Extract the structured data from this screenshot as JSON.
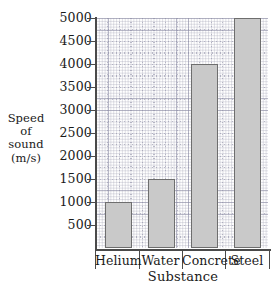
{
  "chart_data": {
    "type": "bar",
    "title": "",
    "xlabel": "Substance",
    "ylabel": "Speed of sound (m/s)",
    "ylabel_lines": [
      "Speed",
      "of",
      "sound",
      "(m/s)"
    ],
    "categories": [
      "Helium",
      "Water",
      "Concrete",
      "Steel"
    ],
    "values": [
      1000,
      1500,
      4000,
      5000
    ],
    "ylim": [
      0,
      5000
    ],
    "ytick_step": 500,
    "yticks": [
      5000,
      4500,
      4000,
      3500,
      3000,
      2500,
      2000,
      1500,
      1000,
      500
    ],
    "ytick_labels": [
      "5000",
      "4500",
      "4000",
      "3500",
      "3000",
      "2500",
      "2000",
      "1500",
      "1000",
      "500"
    ],
    "grid": true,
    "grid_style": "dotted",
    "legend": false,
    "series": [
      {
        "name": "Speed of sound",
        "values": [
          1000,
          1500,
          4000,
          5000
        ]
      }
    ],
    "colors": {
      "bar_fill": "#c9c9c9",
      "bar_edge": "#6e6e6e",
      "axis": "#4a4a4a",
      "grid": "#8c8ca5",
      "text": "#1a1a1a",
      "background": "#ffffff"
    }
  }
}
